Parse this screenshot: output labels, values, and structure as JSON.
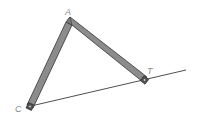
{
  "diagram": {
    "type": "linkage",
    "labels": {
      "a": "A",
      "t": "T",
      "c": "C"
    },
    "points": {
      "A": [
        69,
        20
      ],
      "T": [
        145,
        80
      ],
      "C": [
        30,
        107
      ],
      "line_end": [
        186,
        70
      ]
    },
    "colors": {
      "bar_fill": "#8c8c8c",
      "bar_edge": "#333333",
      "line": "#222222",
      "label": "#8a8a8a"
    }
  }
}
